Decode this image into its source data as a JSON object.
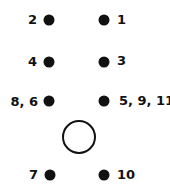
{
  "diagram": {
    "points": [
      {
        "id": "p2",
        "label": "2",
        "side": "left",
        "row": 1
      },
      {
        "id": "p1",
        "label": "1",
        "side": "right",
        "row": 1
      },
      {
        "id": "p4",
        "label": "4",
        "side": "left",
        "row": 2
      },
      {
        "id": "p3",
        "label": "3",
        "side": "right",
        "row": 2
      },
      {
        "id": "p86",
        "label": "8, 6",
        "side": "left",
        "row": 3
      },
      {
        "id": "p5911",
        "label": "5, 9, 11",
        "side": "right",
        "row": 3
      },
      {
        "id": "p7",
        "label": "7",
        "side": "left",
        "row": 5
      },
      {
        "id": "p10",
        "label": "10",
        "side": "right",
        "row": 5
      }
    ],
    "center_marker": {
      "type": "open-circle",
      "row": 4
    },
    "colors": {
      "ink": "#111111",
      "background": "#ffffff"
    }
  }
}
